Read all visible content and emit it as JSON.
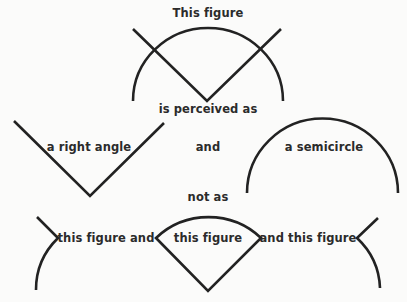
{
  "labels": {
    "title": "This figure",
    "perceived": "is perceived as",
    "right_angle": "a right angle",
    "and": "and",
    "semicircle": "a semicircle",
    "not_as": "not as",
    "frag_left": "this figure and",
    "frag_middle": "this figure",
    "frag_right": "and this figure"
  },
  "colors": {
    "stroke": "#222222",
    "text": "#2b2b2b",
    "background": "#fbfbfa"
  }
}
